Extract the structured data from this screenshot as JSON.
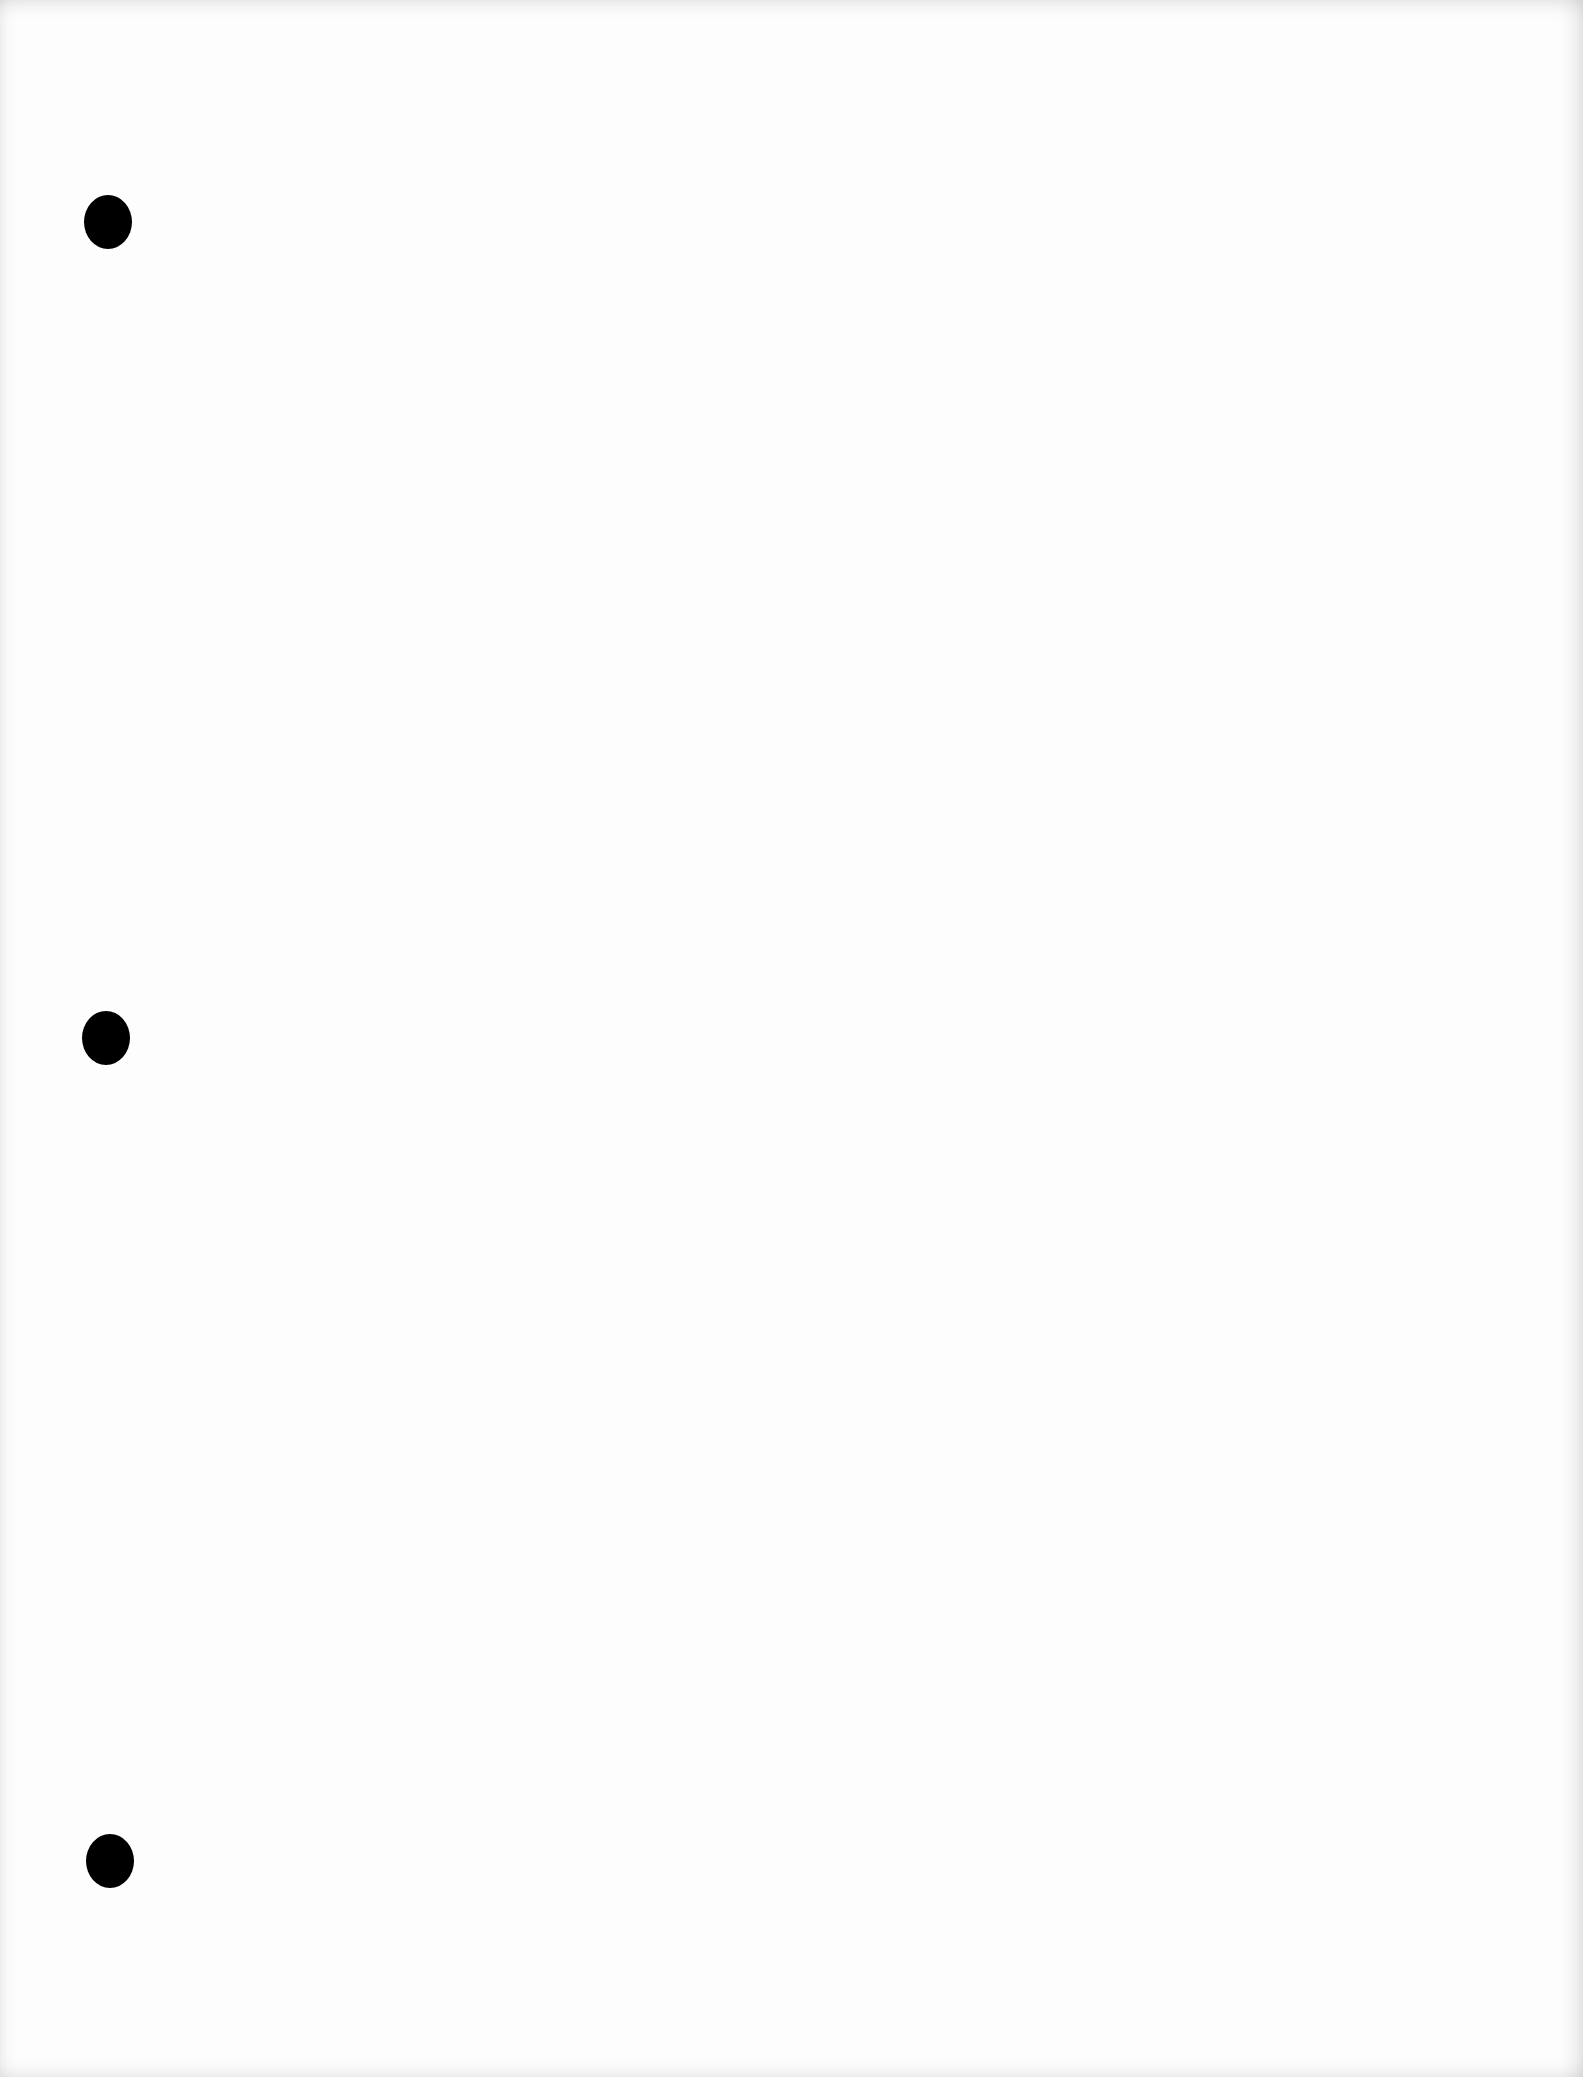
{
  "page": {
    "type": "blank-loose-leaf-sheet",
    "background_color": "#fdfdfd",
    "content_text": ""
  },
  "punch_holes": [
    {
      "cx": 108,
      "cy": 222,
      "w": 48,
      "h": 54,
      "color": "#000000"
    },
    {
      "cx": 106,
      "cy": 1038,
      "w": 48,
      "h": 54,
      "color": "#000000"
    },
    {
      "cx": 110,
      "cy": 1861,
      "w": 48,
      "h": 54,
      "color": "#000000"
    }
  ]
}
